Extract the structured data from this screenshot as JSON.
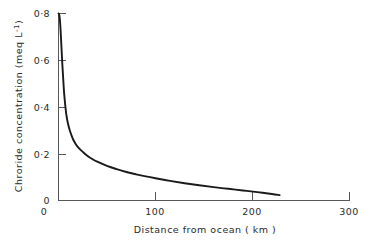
{
  "chart_data": {
    "type": "line",
    "title": "",
    "xlabel": "Distance from ocean ( km )",
    "ylabel": "Chroride concentration (meq L⁻¹)",
    "xlim": [
      0,
      300
    ],
    "ylim": [
      0,
      0.8
    ],
    "grid": false,
    "legend": null,
    "x_ticks": [
      0,
      100,
      200,
      300
    ],
    "x_tick_labels": [
      "0",
      "100",
      "200",
      "300"
    ],
    "y_ticks": [
      0,
      0.2,
      0.4,
      0.6,
      0.8
    ],
    "y_tick_labels": [
      "0",
      "0·2",
      "0·4",
      "0·6",
      "0·8"
    ],
    "series": [
      {
        "name": "Chloride concentration vs distance from ocean",
        "x": [
          0,
          1,
          2,
          3,
          4,
          5,
          6,
          8,
          10,
          12,
          15,
          18,
          21,
          25,
          30,
          35,
          40,
          50,
          60,
          70,
          80,
          90,
          100,
          115,
          130,
          145,
          160,
          175,
          190,
          205,
          220,
          228
        ],
        "y": [
          0.8,
          0.79,
          0.74,
          0.66,
          0.58,
          0.51,
          0.45,
          0.37,
          0.325,
          0.295,
          0.262,
          0.24,
          0.224,
          0.208,
          0.19,
          0.177,
          0.166,
          0.148,
          0.134,
          0.122,
          0.112,
          0.103,
          0.095,
          0.084,
          0.074,
          0.065,
          0.057,
          0.05,
          0.043,
          0.036,
          0.028,
          0.023
        ]
      }
    ]
  },
  "axes": {
    "y_label_text": "Chroride concentration (meq L",
    "y_label_sup": "-1",
    "y_label_tail": ")",
    "x_label_text": "Distance from ocean ( km )"
  },
  "colors": {
    "curve": "#1a1a1a",
    "axis": "#55595c",
    "text": "#2b2b2b",
    "background": "#ffffff"
  }
}
